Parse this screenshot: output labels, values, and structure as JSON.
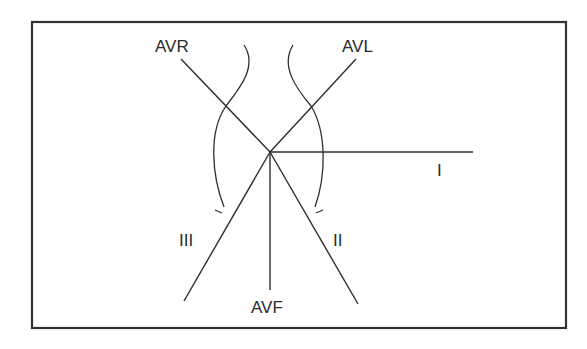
{
  "diagram": {
    "type": "hexaxial-reference-system",
    "leads": [
      {
        "id": "avr",
        "label": "AVR"
      },
      {
        "id": "avl",
        "label": "AVL"
      },
      {
        "id": "i",
        "label": "I"
      },
      {
        "id": "ii",
        "label": "II"
      },
      {
        "id": "iii",
        "label": "III"
      },
      {
        "id": "avf",
        "label": "AVF"
      }
    ],
    "colors": {
      "stroke": "#2e2e2e",
      "frame": "#333333",
      "background": "#ffffff"
    }
  }
}
